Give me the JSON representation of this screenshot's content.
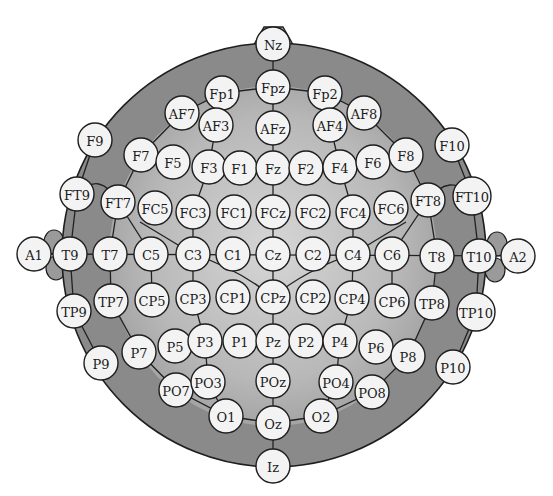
{
  "diagram": {
    "type": "EEG 10-10 electrode placement map",
    "colors": {
      "background": "#ffffff",
      "head_outer": "#8a8a8a",
      "head_inner_light": "#d2d2d2",
      "head_inner_mid": "#a8a8a8",
      "outline": "#1e1e1e",
      "electrode_fill": "#f3f3f3",
      "text": "#1a1a1a"
    },
    "electrodes": [
      {
        "id": "Nz",
        "x": 273,
        "y": 44
      },
      {
        "id": "Fp1",
        "x": 222,
        "y": 93
      },
      {
        "id": "Fpz",
        "x": 273,
        "y": 87
      },
      {
        "id": "Fp2",
        "x": 325,
        "y": 93
      },
      {
        "id": "AF7",
        "x": 182,
        "y": 113
      },
      {
        "id": "AF3",
        "x": 216,
        "y": 125
      },
      {
        "id": "AFz",
        "x": 273,
        "y": 128
      },
      {
        "id": "AF4",
        "x": 330,
        "y": 125
      },
      {
        "id": "AF8",
        "x": 364,
        "y": 113
      },
      {
        "id": "F9",
        "x": 95,
        "y": 140
      },
      {
        "id": "F7",
        "x": 141,
        "y": 155
      },
      {
        "id": "F5",
        "x": 173,
        "y": 162
      },
      {
        "id": "F3",
        "x": 209,
        "y": 167
      },
      {
        "id": "F1",
        "x": 240,
        "y": 168
      },
      {
        "id": "Fz",
        "x": 273,
        "y": 168
      },
      {
        "id": "F2",
        "x": 306,
        "y": 168
      },
      {
        "id": "F4",
        "x": 340,
        "y": 167
      },
      {
        "id": "F6",
        "x": 373,
        "y": 162
      },
      {
        "id": "F8",
        "x": 406,
        "y": 155
      },
      {
        "id": "F10",
        "x": 452,
        "y": 145
      },
      {
        "id": "FT9",
        "x": 77,
        "y": 194
      },
      {
        "id": "FT7",
        "x": 118,
        "y": 202
      },
      {
        "id": "FC5",
        "x": 155,
        "y": 208
      },
      {
        "id": "FC3",
        "x": 193,
        "y": 212
      },
      {
        "id": "FC1",
        "x": 234,
        "y": 212
      },
      {
        "id": "FCz",
        "x": 273,
        "y": 212
      },
      {
        "id": "FC2",
        "x": 313,
        "y": 212
      },
      {
        "id": "FC4",
        "x": 353,
        "y": 212
      },
      {
        "id": "FC6",
        "x": 391,
        "y": 208
      },
      {
        "id": "FT8",
        "x": 428,
        "y": 200
      },
      {
        "id": "FT10",
        "x": 472,
        "y": 196
      },
      {
        "id": "A1",
        "x": 34,
        "y": 254
      },
      {
        "id": "T9",
        "x": 70,
        "y": 254
      },
      {
        "id": "T7",
        "x": 110,
        "y": 254
      },
      {
        "id": "C5",
        "x": 151,
        "y": 254
      },
      {
        "id": "C3",
        "x": 193,
        "y": 254
      },
      {
        "id": "C1",
        "x": 233,
        "y": 254
      },
      {
        "id": "Cz",
        "x": 273,
        "y": 254
      },
      {
        "id": "C2",
        "x": 313,
        "y": 254
      },
      {
        "id": "C4",
        "x": 353,
        "y": 254
      },
      {
        "id": "C6",
        "x": 392,
        "y": 254
      },
      {
        "id": "T8",
        "x": 437,
        "y": 256
      },
      {
        "id": "T10",
        "x": 479,
        "y": 256
      },
      {
        "id": "A2",
        "x": 518,
        "y": 256
      },
      {
        "id": "TP9",
        "x": 74,
        "y": 311
      },
      {
        "id": "TP7",
        "x": 111,
        "y": 301
      },
      {
        "id": "CP5",
        "x": 152,
        "y": 300
      },
      {
        "id": "CP3",
        "x": 193,
        "y": 298
      },
      {
        "id": "CP1",
        "x": 233,
        "y": 297
      },
      {
        "id": "CPz",
        "x": 273,
        "y": 297
      },
      {
        "id": "CP2",
        "x": 313,
        "y": 297
      },
      {
        "id": "CP4",
        "x": 352,
        "y": 298
      },
      {
        "id": "CP6",
        "x": 392,
        "y": 301
      },
      {
        "id": "TP8",
        "x": 432,
        "y": 303
      },
      {
        "id": "TP10",
        "x": 476,
        "y": 312
      },
      {
        "id": "P9",
        "x": 101,
        "y": 363
      },
      {
        "id": "P7",
        "x": 139,
        "y": 352
      },
      {
        "id": "P5",
        "x": 175,
        "y": 346
      },
      {
        "id": "P3",
        "x": 205,
        "y": 341
      },
      {
        "id": "P1",
        "x": 240,
        "y": 341
      },
      {
        "id": "Pz",
        "x": 273,
        "y": 341
      },
      {
        "id": "P2",
        "x": 306,
        "y": 341
      },
      {
        "id": "P4",
        "x": 340,
        "y": 341
      },
      {
        "id": "P6",
        "x": 376,
        "y": 347
      },
      {
        "id": "P8",
        "x": 408,
        "y": 356
      },
      {
        "id": "P10",
        "x": 453,
        "y": 367
      },
      {
        "id": "PO7",
        "x": 176,
        "y": 390
      },
      {
        "id": "PO3",
        "x": 208,
        "y": 382
      },
      {
        "id": "POz",
        "x": 273,
        "y": 381
      },
      {
        "id": "PO4",
        "x": 336,
        "y": 382
      },
      {
        "id": "PO8",
        "x": 372,
        "y": 392
      },
      {
        "id": "O1",
        "x": 226,
        "y": 416
      },
      {
        "id": "Oz",
        "x": 273,
        "y": 423
      },
      {
        "id": "O2",
        "x": 321,
        "y": 416
      },
      {
        "id": "Iz",
        "x": 273,
        "y": 466
      }
    ]
  }
}
